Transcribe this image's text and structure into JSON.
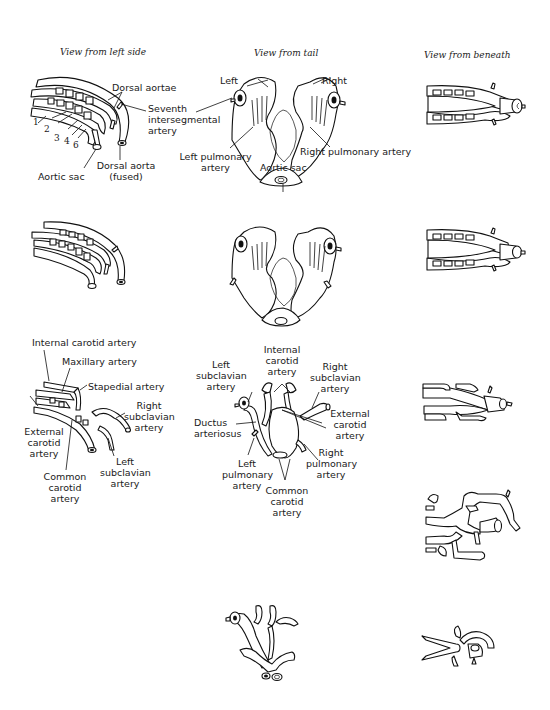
{
  "column_headings": {
    "left": "View from left side",
    "tail": "View from tail",
    "beneath": "View from beneath"
  },
  "row1": {
    "left_side": {
      "labels": {
        "dorsal_aortae": "Dorsal aortae",
        "seventh_intersegmental": [
          "Seventh",
          "intersegmental",
          "artery"
        ],
        "aortic_sac": "Aortic sac",
        "dorsal_aorta_fused": [
          "Dorsal aorta",
          "(fused)"
        ]
      },
      "arch_numbers": [
        "1",
        "2",
        "3",
        "4",
        "6"
      ]
    },
    "tail": {
      "labels": {
        "left": "Left",
        "right": "Right",
        "left_pulmonary": [
          "Left pulmonary",
          "artery"
        ],
        "right_pulmonary": "Right pulmonary artery",
        "aortic_sac": "Aortic sac"
      }
    }
  },
  "row3": {
    "left_side": {
      "labels": {
        "internal_carotid": "Internal carotid artery",
        "maxillary": "Maxillary artery",
        "stapedial": "Stapedial artery",
        "right_subclavian": [
          "Right",
          "subclavian",
          "artery"
        ],
        "external_carotid": [
          "External",
          "carotid",
          "artery"
        ],
        "common_carotid": [
          "Common",
          "carotid",
          "artery"
        ],
        "left_subclavian": [
          "Left",
          "subclavian",
          "artery"
        ]
      }
    },
    "tail": {
      "labels": {
        "internal_carotid": [
          "Internal",
          "carotid",
          "artery"
        ],
        "left_subclavian": [
          "Left",
          "subclavian",
          "artery"
        ],
        "right_subclavian": [
          "Right",
          "subclavian",
          "artery"
        ],
        "ductus_arteriosus": [
          "Ductus",
          "arteriosus"
        ],
        "external_carotid": [
          "External",
          "carotid",
          "artery"
        ],
        "left_pulmonary": [
          "Left",
          "pulmonary",
          "artery"
        ],
        "right_pulmonary": [
          "Right",
          "pulmonary",
          "artery"
        ],
        "common_carotid": [
          "Common",
          "carotid",
          "artery"
        ]
      }
    }
  }
}
